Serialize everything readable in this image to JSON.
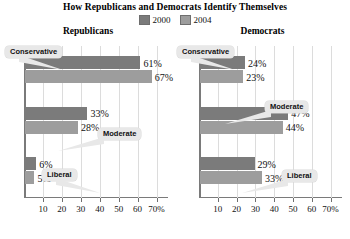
{
  "chart_data": {
    "type": "bar",
    "orientation": "horizontal",
    "title": "How Republicans and Democrats Identify Themselves",
    "xlabel": "",
    "ylabel": "",
    "xlim": [
      0,
      75
    ],
    "grid": true,
    "legend_position": "top-center",
    "legend": [
      "2000",
      "2004"
    ],
    "colors": {
      "y2000": "#7b7b7b",
      "y2004": "#9d9d9d",
      "callout_bg": "#e8e8e8",
      "grid": "#dcdcdc",
      "axis": "#7a7a7a"
    },
    "tick_values": [
      10,
      20,
      30,
      40,
      50,
      60,
      70
    ],
    "tick_labels": [
      "10",
      "20",
      "30",
      "40",
      "50",
      "60",
      "70%"
    ],
    "categories": [
      "Conservative",
      "Moderate",
      "Liberal"
    ],
    "panels": [
      {
        "name": "Republicans",
        "series": [
          {
            "name": "2000",
            "values": [
              61,
              33,
              6
            ],
            "labels": [
              "61%",
              "33%",
              "6%"
            ]
          },
          {
            "name": "2004",
            "values": [
              67,
              28,
              5
            ],
            "labels": [
              "67%",
              "28%",
              "5%"
            ]
          }
        ],
        "callouts": [
          {
            "label": "Conservative",
            "left": 3,
            "top": 0
          },
          {
            "label": "Moderate",
            "left": 96,
            "top": 82
          },
          {
            "label": "Liberal",
            "left": 40,
            "top": 123
          }
        ]
      },
      {
        "name": "Democrats",
        "series": [
          {
            "name": "2000",
            "values": [
              24,
              47,
              29
            ],
            "labels": [
              "24%",
              "47%",
              "29%"
            ]
          },
          {
            "name": "2004",
            "values": [
              23,
              44,
              33
            ],
            "labels": [
              "23%",
              "44%",
              "33%"
            ]
          }
        ],
        "callouts": [
          {
            "label": "Conservative",
            "left": 0,
            "top": 0
          },
          {
            "label": "Moderate",
            "left": 88,
            "top": 55
          },
          {
            "label": "Liberal",
            "left": 105,
            "top": 124
          }
        ]
      }
    ]
  }
}
